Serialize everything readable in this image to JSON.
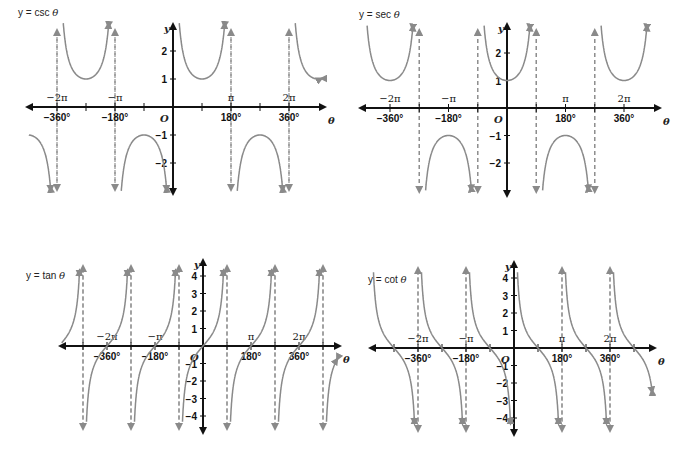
{
  "chart_data": [
    {
      "type": "line",
      "title": "y = csc θ",
      "function": "csc",
      "xlabel": "θ",
      "ylabel": "y",
      "origin_label": "O",
      "x_ticks_deg": [
        "−360°",
        "−180°",
        "180°",
        "360°"
      ],
      "x_ticks_rad": [
        "−2π",
        "−π",
        "π",
        "2π"
      ],
      "y_ticks": [
        "2",
        "1",
        "−1",
        "−2"
      ],
      "xlim_deg": [
        -450,
        450
      ],
      "ylim": [
        -3,
        3
      ],
      "asymptotes_deg": [
        -360,
        -180,
        0,
        180,
        360
      ],
      "local_extrema": [
        {
          "x": -270,
          "y": 1
        },
        {
          "x": -90,
          "y": -1
        },
        {
          "x": 90,
          "y": 1
        },
        {
          "x": 270,
          "y": -1
        }
      ]
    },
    {
      "type": "line",
      "title": "y = sec θ",
      "function": "sec",
      "xlabel": "θ",
      "ylabel": "y",
      "origin_label": "O",
      "x_ticks_deg": [
        "−360°",
        "−180°",
        "180°",
        "360°"
      ],
      "x_ticks_rad": [
        "−2π",
        "−π",
        "π",
        "2π"
      ],
      "y_ticks": [
        "2",
        "1",
        "−1",
        "−2"
      ],
      "xlim_deg": [
        -450,
        450
      ],
      "ylim": [
        -3,
        3
      ],
      "asymptotes_deg": [
        -270,
        -90,
        90,
        270
      ],
      "local_extrema": [
        {
          "x": -360,
          "y": 1
        },
        {
          "x": -180,
          "y": -1
        },
        {
          "x": 0,
          "y": 1
        },
        {
          "x": 180,
          "y": -1
        },
        {
          "x": 360,
          "y": 1
        }
      ]
    },
    {
      "type": "line",
      "title": "y = tan θ",
      "function": "tan",
      "xlabel": "θ",
      "ylabel": "y",
      "origin_label": "O",
      "x_ticks_deg": [
        "−360°",
        "−180°",
        "180°",
        "360°"
      ],
      "x_ticks_rad": [
        "−2π",
        "−π",
        "π",
        "2π"
      ],
      "y_ticks": [
        "4",
        "3",
        "2",
        "1",
        "−1",
        "−2",
        "−3",
        "−4"
      ],
      "xlim_deg": [
        -540,
        540
      ],
      "ylim": [
        -4.5,
        4.5
      ],
      "asymptotes_deg": [
        -450,
        -270,
        -90,
        90,
        270,
        450
      ],
      "zeros_deg": [
        -360,
        -180,
        0,
        180,
        360
      ]
    },
    {
      "type": "line",
      "title": "y = cot θ",
      "function": "cot",
      "xlabel": "θ",
      "ylabel": "y",
      "origin_label": "O",
      "x_ticks_deg": [
        "−360°",
        "−180°",
        "180°",
        "360°"
      ],
      "x_ticks_rad": [
        "−2π",
        "−π",
        "π",
        "2π"
      ],
      "y_ticks": [
        "4",
        "3",
        "2",
        "1",
        "−1",
        "−2",
        "−3",
        "−4"
      ],
      "xlim_deg": [
        -540,
        540
      ],
      "ylim": [
        -4.5,
        4.5
      ],
      "asymptotes_deg": [
        -360,
        -180,
        0,
        180,
        360
      ],
      "zeros_deg": [
        -450,
        -270,
        -90,
        90,
        270,
        450
      ]
    }
  ],
  "graphs": {
    "csc": {
      "title_prefix": "y = csc ",
      "title_var": "θ"
    },
    "sec": {
      "title_prefix": "y = sec ",
      "title_var": "θ"
    },
    "tan": {
      "title_prefix": "y = tan ",
      "title_var": "θ"
    },
    "cot": {
      "title_prefix": "y = cot ",
      "title_var": "θ"
    }
  },
  "colors": {
    "axis": "#111111",
    "curve": "#8a8a8a",
    "asymptote": "#8a8a8a"
  }
}
